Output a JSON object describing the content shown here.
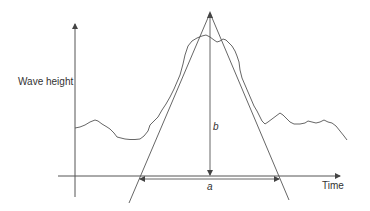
{
  "diagram": {
    "y_axis_label": "Wave height",
    "x_axis_label": "Time",
    "height_label": "b",
    "base_label": "a",
    "colors": {
      "line": "#555555",
      "text": "#333333",
      "background": "#ffffff"
    }
  }
}
